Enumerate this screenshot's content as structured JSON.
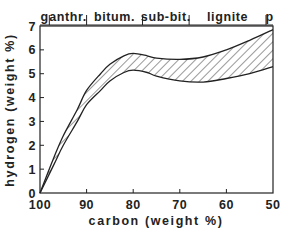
{
  "chart_data": {
    "type": "area",
    "title": "",
    "xlabel": "carbon (weight %)",
    "ylabel": "hydrogen (weight %)",
    "xlim": [
      100,
      50
    ],
    "ylim": [
      0,
      7
    ],
    "x_reversed": true,
    "xticks": [
      100,
      90,
      80,
      70,
      60,
      50
    ],
    "yticks": [
      0,
      1,
      2,
      3,
      4,
      5,
      6,
      7
    ],
    "grid": false,
    "legend": null,
    "fill_pattern": "diagonal-hatch",
    "rank_bands": [
      {
        "label": "g",
        "from": 100,
        "to": 98
      },
      {
        "label": "anthr.",
        "from": 98,
        "to": 90
      },
      {
        "label": "bitum.",
        "from": 90,
        "to": 78
      },
      {
        "label": "sub-bit.",
        "from": 78,
        "to": 68
      },
      {
        "label": "lignite",
        "from": 68,
        "to": 51.5
      },
      {
        "label": "p",
        "from": 51.5,
        "to": 50
      }
    ],
    "series": [
      {
        "name": "upper bound",
        "x": [
          100,
          97,
          95,
          92,
          90,
          87,
          85,
          82,
          80,
          77,
          75,
          70,
          65,
          60,
          55,
          50
        ],
        "values": [
          0,
          1.5,
          2.4,
          3.5,
          4.3,
          5.0,
          5.4,
          5.75,
          5.85,
          5.75,
          5.65,
          5.6,
          5.7,
          6.0,
          6.4,
          6.85
        ]
      },
      {
        "name": "lower bound",
        "x": [
          100,
          97,
          95,
          92,
          90,
          87,
          85,
          82,
          80,
          77,
          75,
          70,
          65,
          60,
          55,
          50
        ],
        "values": [
          0,
          1.2,
          2.0,
          3.0,
          3.7,
          4.3,
          4.7,
          5.05,
          5.15,
          5.05,
          4.9,
          4.7,
          4.65,
          4.8,
          5.0,
          5.3
        ]
      }
    ]
  },
  "labels": {
    "xlabel": "carbon (weight %)",
    "ylabel": "hydrogen (weight %)",
    "xticks": [
      "100",
      "90",
      "80",
      "70",
      "60",
      "50"
    ],
    "yticks": [
      "0",
      "1",
      "2",
      "3",
      "4",
      "5",
      "6",
      "7"
    ],
    "ranks": [
      "g",
      "anthr.",
      "bitum.",
      "sub-bit.",
      "lignite",
      "p"
    ]
  },
  "colors": {
    "ink": "#222222",
    "background": "#ffffff"
  }
}
